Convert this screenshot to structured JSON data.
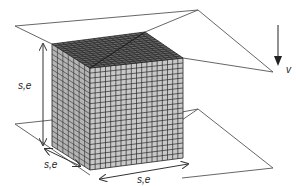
{
  "diagram": {
    "labels": {
      "height": "s,e",
      "depth": "s,e",
      "width": "s,e",
      "velocity": "v"
    },
    "colors": {
      "background": "#ffffff",
      "front_face": "#c8c8c8",
      "side_face": "#b4b4b4",
      "top_face": "#6a6a6a",
      "grid_lines": "#2a2a2a",
      "plane_lines": "#555555"
    },
    "grid": {
      "front_cells_x": 18,
      "front_cells_y": 20,
      "side_cells_x": 7,
      "top_cells_depth": 7
    }
  }
}
